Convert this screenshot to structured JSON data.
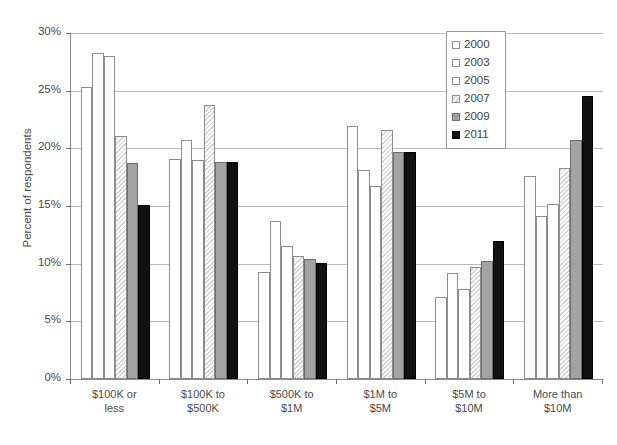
{
  "chart_data": {
    "type": "bar",
    "title": "",
    "xlabel": "",
    "ylabel": "Percent of respondents",
    "ylim": [
      0,
      30
    ],
    "ytick_labels": [
      "0%",
      "5%",
      "10%",
      "15%",
      "20%",
      "25%",
      "30%"
    ],
    "ytick_values": [
      0,
      5,
      10,
      15,
      20,
      25,
      30
    ],
    "grid": true,
    "legend_position": "top-right",
    "categories": [
      "$100K or less",
      "$100K to $500K",
      "$500K to $1M",
      "$1M to $5M",
      "$5M to $10M",
      "More than $10M"
    ],
    "category_lines": [
      [
        "$100K or",
        "less"
      ],
      [
        "$100K to",
        "$500K"
      ],
      [
        "$500K to",
        "$1M"
      ],
      [
        "$1M to",
        "$5M"
      ],
      [
        "$5M to",
        "$10M"
      ],
      [
        "More than",
        "$10M"
      ]
    ],
    "series": [
      {
        "name": "2000",
        "style": "white",
        "color": "#ffffff",
        "values": [
          25.3,
          19.1,
          9.3,
          21.9,
          7.1,
          17.6
        ]
      },
      {
        "name": "2003",
        "style": "white",
        "color": "#ffffff",
        "values": [
          28.3,
          20.7,
          13.7,
          18.1,
          9.2,
          14.1
        ]
      },
      {
        "name": "2005",
        "style": "white",
        "color": "#ffffff",
        "values": [
          28.0,
          19.0,
          11.5,
          16.7,
          7.8,
          15.2
        ]
      },
      {
        "name": "2007",
        "style": "hatched",
        "color": "#f0f0f0",
        "values": [
          21.1,
          23.8,
          10.7,
          21.6,
          9.7,
          18.3
        ]
      },
      {
        "name": "2009",
        "style": "gray",
        "color": "#a3a3a3",
        "values": [
          18.7,
          18.8,
          10.4,
          19.7,
          10.2,
          20.7
        ]
      },
      {
        "name": "2011",
        "style": "black",
        "color": "#111111",
        "values": [
          15.1,
          18.8,
          10.1,
          19.7,
          12.0,
          24.5
        ]
      }
    ]
  },
  "legend": {
    "items": [
      {
        "label": "2000"
      },
      {
        "label": "2003"
      },
      {
        "label": "2005"
      },
      {
        "label": "2007"
      },
      {
        "label": "2009"
      },
      {
        "label": "2011"
      }
    ]
  }
}
